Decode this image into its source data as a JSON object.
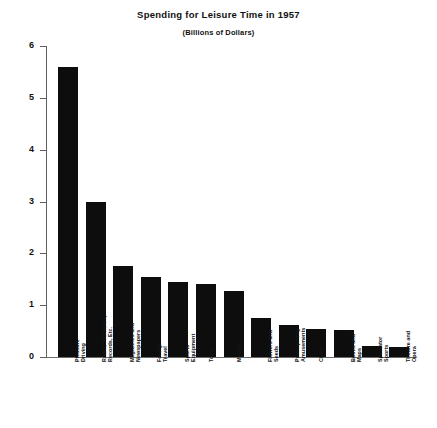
{
  "chart_data": {
    "type": "bar",
    "title": "Spending for Leisure Time in 1957",
    "subtitle": "(Billions of Dollars)",
    "xlabel": "",
    "ylabel": "",
    "ylim": [
      0,
      6
    ],
    "yticks": [
      0,
      1,
      2,
      3,
      4,
      5,
      6
    ],
    "ytick_labels": [
      "0",
      "1",
      "2",
      "3",
      "4",
      "5",
      "6"
    ],
    "grid": false,
    "legend": false,
    "orientation": "vertical",
    "bar_color": "#0d0d0d",
    "categories": [
      "Pleasure Driving",
      "Radio, Television, Records, Etc.",
      "Magazines and Newspapers",
      "Foreign Travel",
      "Sports Equipment",
      "Toys",
      "Movies",
      "Flowers and Seeds",
      "Participating Amusements",
      "Clubs",
      "Books and Maps",
      "Spectator Sports",
      "Theatre and Opera"
    ],
    "category_lines": [
      [
        "Pleasure",
        "Driving"
      ],
      [
        "Radio, Television,",
        "Records, Etc."
      ],
      [
        "Magazines and",
        "Newspapers"
      ],
      [
        "Foreign",
        "Travel"
      ],
      [
        "Sports",
        "Equipment"
      ],
      [
        "Toys"
      ],
      [
        "Movies"
      ],
      [
        "Flowers and",
        "Seeds"
      ],
      [
        "Participating",
        "Amusements"
      ],
      [
        "Clubs"
      ],
      [
        "Books and",
        "Maps"
      ],
      [
        "Spectator",
        "Sports"
      ],
      [
        "Theatre and",
        "Opera"
      ]
    ],
    "values": [
      5.6,
      3.0,
      1.75,
      1.55,
      1.45,
      1.4,
      1.28,
      0.75,
      0.62,
      0.55,
      0.52,
      0.22,
      0.2
    ]
  }
}
